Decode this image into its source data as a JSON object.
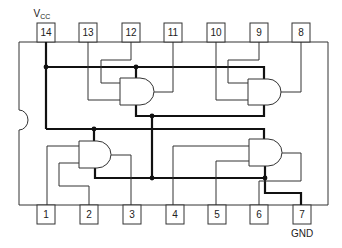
{
  "diagram": {
    "labels": {
      "vcc_main": "V",
      "vcc_sub": "CC",
      "gnd": "GND"
    },
    "top_pins": [
      {
        "number": "14",
        "x": 37
      },
      {
        "number": "13",
        "x": 79
      },
      {
        "number": "12",
        "x": 122
      },
      {
        "number": "11",
        "x": 164
      },
      {
        "number": "10",
        "x": 207
      },
      {
        "number": "9",
        "x": 250
      },
      {
        "number": "8",
        "x": 292
      }
    ],
    "bottom_pins": [
      {
        "number": "1",
        "x": 37
      },
      {
        "number": "2",
        "x": 80
      },
      {
        "number": "3",
        "x": 123
      },
      {
        "number": "4",
        "x": 166
      },
      {
        "number": "5",
        "x": 208
      },
      {
        "number": "6",
        "x": 250
      },
      {
        "number": "7",
        "x": 293
      }
    ],
    "gates": [
      {
        "id": "gate-1",
        "type": "AND",
        "inputs": [
          "12",
          "13"
        ],
        "output": "11"
      },
      {
        "id": "gate-2",
        "type": "AND",
        "inputs": [
          "9",
          "10"
        ],
        "output": "8"
      },
      {
        "id": "gate-3",
        "type": "AND",
        "inputs": [
          "1",
          "2"
        ],
        "output": "3"
      },
      {
        "id": "gate-4",
        "type": "AND",
        "inputs": [
          "4",
          "5"
        ],
        "output": "6"
      }
    ],
    "colors": {
      "line": "#333333",
      "bus": "#111111",
      "background": "#ffffff"
    }
  }
}
